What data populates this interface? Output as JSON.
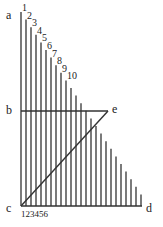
{
  "diagram": {
    "points": {
      "a": {
        "label": "a",
        "x": 6,
        "y": 19
      },
      "b": {
        "label": "b",
        "x": 6,
        "y": 114
      },
      "c": {
        "label": "c",
        "x": 6,
        "y": 212
      },
      "d": {
        "label": "d",
        "x": 146,
        "y": 212
      },
      "e": {
        "label": "e",
        "x": 112,
        "y": 113
      }
    },
    "origin": {
      "x": 21,
      "y": 206
    },
    "line_count": 25,
    "line_spacing": 5,
    "top_y": 12,
    "drop_per_line": 7.6,
    "horizontal_b_y": 111,
    "e_x": 108,
    "baseline_end_x": 142,
    "top_numbers": [
      "1",
      "2",
      "3",
      "4",
      "5",
      "6",
      "7",
      "8",
      "9",
      "10"
    ],
    "bottom_numbers": "123456",
    "stroke_color": "#333333"
  }
}
